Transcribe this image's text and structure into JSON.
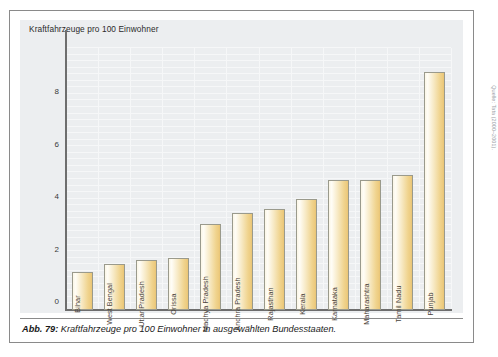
{
  "figure": {
    "caption_prefix": "Abb. 79:",
    "caption_text": "Kraftfahrzeuge pro 100 Einwohner in ausgewählten Bundesstaaten.",
    "source_credit": "Quelle: Tata (2000–2001)."
  },
  "chart_data": {
    "type": "bar",
    "title": "Kraftfahrzeuge pro 100 Einwohner",
    "xlabel": "",
    "ylabel": "",
    "ylim": [
      0,
      10
    ],
    "yticks": [
      0,
      2,
      4,
      6,
      8
    ],
    "ytick_labels": [
      "0",
      "2",
      "4",
      "6",
      "8"
    ],
    "grid": true,
    "legend": "none",
    "categories": [
      "Bihar",
      "West Bengal",
      "Uttar Pradesh",
      "Orissa",
      "Madhya Pradesh",
      "Andhra Pradesh",
      "Rajasthan",
      "Kerala",
      "Karnataka",
      "Maharashtra",
      "Tamil Nadu",
      "Punjab"
    ],
    "values": [
      1.45,
      1.75,
      1.9,
      2.0,
      3.3,
      3.7,
      3.85,
      4.25,
      4.95,
      4.95,
      5.15,
      9.1
    ],
    "bar_color": "#f0d48f",
    "bar_edge_color": "#9a9a8c",
    "panel_color": "#eceef0"
  }
}
